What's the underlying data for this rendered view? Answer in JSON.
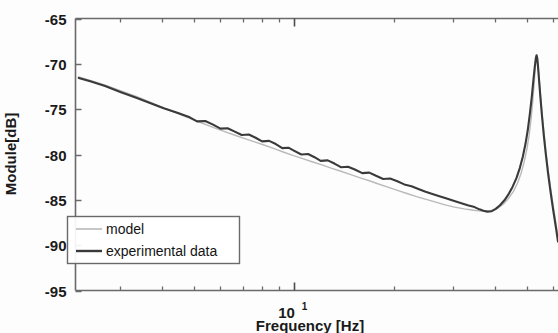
{
  "chart_data": {
    "type": "line",
    "title": "",
    "xlabel": "Frequency [Hz]",
    "ylabel": "Module[dB]",
    "xscale": "log",
    "yscale": "linear",
    "xlim": [
      2.2,
      62.0
    ],
    "ylim": [
      -95,
      -65
    ],
    "grid": false,
    "legend_position": "lower left",
    "x_major_ticks": [
      10
    ],
    "x_major_tick_labels": [
      "10¹"
    ],
    "x_minor_ticks": [
      3,
      4,
      5,
      6,
      7,
      8,
      9,
      20,
      30,
      40,
      50,
      60
    ],
    "y_ticks": [
      -65,
      -70,
      -75,
      -80,
      -85,
      -90,
      -95
    ],
    "y_tick_labels": [
      "-65",
      "-70",
      "-75",
      "-80",
      "-85",
      "-90",
      "-95"
    ],
    "series": [
      {
        "name": "model",
        "color": "#b9b9b9",
        "linewidth": 1.4,
        "points": [
          [
            2.25,
            -71.45
          ],
          [
            2.45,
            -71.85
          ],
          [
            2.7,
            -72.35
          ],
          [
            3.0,
            -72.95
          ],
          [
            3.35,
            -73.6
          ],
          [
            3.7,
            -74.25
          ],
          [
            4.05,
            -74.85
          ],
          [
            4.45,
            -75.45
          ],
          [
            4.85,
            -76.0
          ],
          [
            5.25,
            -76.5
          ],
          [
            5.7,
            -77.0
          ],
          [
            6.15,
            -77.45
          ],
          [
            6.6,
            -77.85
          ],
          [
            7.1,
            -78.25
          ],
          [
            7.6,
            -78.6
          ],
          [
            8.1,
            -78.95
          ],
          [
            8.7,
            -79.35
          ],
          [
            9.3,
            -79.75
          ],
          [
            9.9,
            -80.1
          ],
          [
            10.6,
            -80.45
          ],
          [
            11.3,
            -80.8
          ],
          [
            12.1,
            -81.15
          ],
          [
            12.9,
            -81.5
          ],
          [
            13.8,
            -81.85
          ],
          [
            14.7,
            -82.2
          ],
          [
            15.7,
            -82.55
          ],
          [
            16.8,
            -82.9
          ],
          [
            17.9,
            -83.25
          ],
          [
            19.1,
            -83.6
          ],
          [
            20.4,
            -83.95
          ],
          [
            21.8,
            -84.3
          ],
          [
            23.3,
            -84.65
          ],
          [
            24.9,
            -84.95
          ],
          [
            26.6,
            -85.25
          ],
          [
            28.4,
            -85.55
          ],
          [
            30.3,
            -85.8
          ],
          [
            32.4,
            -86.0
          ],
          [
            34.6,
            -86.15
          ],
          [
            36.5,
            -86.25
          ],
          [
            38.0,
            -86.25
          ],
          [
            39.5,
            -86.15
          ],
          [
            41.0,
            -85.9
          ],
          [
            42.5,
            -85.45
          ],
          [
            44.0,
            -84.85
          ],
          [
            45.5,
            -84.1
          ],
          [
            46.8,
            -83.2
          ],
          [
            48.0,
            -82.1
          ],
          [
            49.0,
            -80.9
          ],
          [
            50.0,
            -79.4
          ],
          [
            50.8,
            -77.8
          ],
          [
            51.5,
            -76.0
          ],
          [
            52.1,
            -74.0
          ],
          [
            52.6,
            -72.0
          ],
          [
            53.0,
            -70.4
          ],
          [
            53.3,
            -69.4
          ],
          [
            53.5,
            -69.05
          ],
          [
            53.7,
            -69.25
          ],
          [
            54.0,
            -70.1
          ],
          [
            54.4,
            -71.6
          ],
          [
            54.9,
            -73.4
          ],
          [
            55.5,
            -75.4
          ],
          [
            56.2,
            -77.5
          ],
          [
            57.0,
            -79.6
          ],
          [
            57.9,
            -81.7
          ],
          [
            58.9,
            -83.7
          ],
          [
            60.0,
            -85.7
          ],
          [
            61.2,
            -87.7
          ],
          [
            62.0,
            -89.2
          ]
        ]
      },
      {
        "name": "experimental data",
        "color": "#3a3a3a",
        "linewidth": 2.1,
        "points": [
          [
            2.25,
            -71.55
          ],
          [
            2.45,
            -71.95
          ],
          [
            2.7,
            -72.45
          ],
          [
            3.0,
            -73.1
          ],
          [
            3.35,
            -73.75
          ],
          [
            3.7,
            -74.35
          ],
          [
            4.05,
            -74.9
          ],
          [
            4.45,
            -75.4
          ],
          [
            4.85,
            -75.9
          ],
          [
            5.1,
            -76.35
          ],
          [
            5.4,
            -76.3
          ],
          [
            5.7,
            -76.7
          ],
          [
            6.0,
            -77.15
          ],
          [
            6.3,
            -77.1
          ],
          [
            6.6,
            -77.45
          ],
          [
            6.95,
            -77.85
          ],
          [
            7.3,
            -77.8
          ],
          [
            7.65,
            -78.15
          ],
          [
            8.0,
            -78.55
          ],
          [
            8.4,
            -78.5
          ],
          [
            8.8,
            -78.85
          ],
          [
            9.2,
            -79.3
          ],
          [
            9.6,
            -79.25
          ],
          [
            10.0,
            -79.6
          ],
          [
            10.5,
            -80.0
          ],
          [
            11.0,
            -79.95
          ],
          [
            11.5,
            -80.3
          ],
          [
            12.0,
            -80.7
          ],
          [
            12.6,
            -80.65
          ],
          [
            13.2,
            -81.0
          ],
          [
            13.8,
            -81.4
          ],
          [
            14.5,
            -81.35
          ],
          [
            15.2,
            -81.65
          ],
          [
            16.0,
            -82.05
          ],
          [
            16.8,
            -82.0
          ],
          [
            17.6,
            -82.35
          ],
          [
            18.5,
            -82.7
          ],
          [
            19.4,
            -82.65
          ],
          [
            20.4,
            -82.95
          ],
          [
            21.4,
            -83.3
          ],
          [
            22.5,
            -83.5
          ],
          [
            23.6,
            -83.8
          ],
          [
            24.8,
            -84.1
          ],
          [
            26.0,
            -84.35
          ],
          [
            27.3,
            -84.6
          ],
          [
            28.7,
            -84.85
          ],
          [
            30.1,
            -85.1
          ],
          [
            31.6,
            -85.35
          ],
          [
            33.2,
            -85.6
          ],
          [
            34.8,
            -85.8
          ],
          [
            36.0,
            -86.05
          ],
          [
            37.0,
            -86.2
          ],
          [
            38.0,
            -86.3
          ],
          [
            39.2,
            -86.25
          ],
          [
            40.3,
            -86.0
          ],
          [
            41.5,
            -85.6
          ],
          [
            42.8,
            -85.05
          ],
          [
            44.0,
            -84.4
          ],
          [
            45.3,
            -83.55
          ],
          [
            46.5,
            -82.6
          ],
          [
            47.6,
            -81.5
          ],
          [
            48.6,
            -80.25
          ],
          [
            49.5,
            -78.85
          ],
          [
            50.3,
            -77.3
          ],
          [
            51.0,
            -75.6
          ],
          [
            51.7,
            -73.7
          ],
          [
            52.3,
            -71.8
          ],
          [
            52.8,
            -70.3
          ],
          [
            53.2,
            -69.35
          ],
          [
            53.45,
            -69.05
          ],
          [
            53.7,
            -69.35
          ],
          [
            54.0,
            -70.3
          ],
          [
            54.4,
            -71.85
          ],
          [
            54.9,
            -73.7
          ],
          [
            55.5,
            -75.75
          ],
          [
            56.2,
            -77.9
          ],
          [
            57.0,
            -80.0
          ],
          [
            57.9,
            -82.1
          ],
          [
            58.9,
            -84.15
          ],
          [
            60.0,
            -86.2
          ],
          [
            61.2,
            -88.2
          ],
          [
            62.0,
            -89.6
          ]
        ]
      }
    ],
    "annotations": {
      "peak_value_db": -69.05,
      "peak_frequency_hz": 53.5,
      "minimum_value_db": -86.3,
      "minimum_frequency_hz": 38.0,
      "start_value_db": -71.5
    }
  },
  "legend": {
    "items": [
      {
        "label": "model",
        "color": "#b9b9b9"
      },
      {
        "label": "experimental data",
        "color": "#3a3a3a"
      }
    ]
  },
  "axes": {
    "x_title": "Frequency [Hz]",
    "y_title": "Module[dB]",
    "x_tick_base": "10",
    "x_tick_exponent": "1",
    "y_tick_labels": [
      "-65",
      "-70",
      "-75",
      "-80",
      "-85",
      "-90",
      "-95"
    ]
  },
  "colors": {
    "axis": "#4d4d4d",
    "text": "#1a1a1a",
    "model_line": "#b9b9b9",
    "experimental_line": "#3a3a3a",
    "background": "#fdfdfd"
  }
}
